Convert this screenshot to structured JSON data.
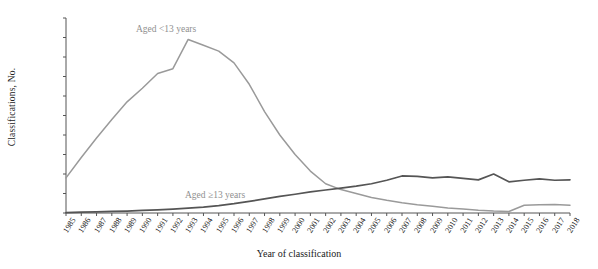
{
  "axes": {
    "ylabel": "Classifications, No.",
    "xlabel": "Year of classification",
    "yticks": [
      "0",
      "100",
      "200",
      "300",
      "400",
      "500",
      "600",
      "700",
      "800",
      "900",
      "1,000"
    ],
    "ylim": [
      0,
      1000
    ]
  },
  "labels": {
    "young": "Aged <13 years",
    "old": "Aged ≥13 years"
  },
  "colors": {
    "young_line": "#9a9a9a",
    "old_line": "#555555",
    "axis": "#555555",
    "text": "#222222"
  },
  "chart_data": {
    "type": "line",
    "title": "",
    "xlabel": "Year of classification",
    "ylabel": "Classifications, No.",
    "ylim": [
      0,
      1000
    ],
    "grid": false,
    "legend": "inline-annotations",
    "x": [
      1985,
      1986,
      1987,
      1988,
      1989,
      1990,
      1991,
      1992,
      1993,
      1994,
      1995,
      1996,
      1997,
      1998,
      1999,
      2000,
      2001,
      2002,
      2003,
      2004,
      2005,
      2006,
      2007,
      2008,
      2009,
      2010,
      2011,
      2012,
      2013,
      2014,
      2015,
      2016,
      2017,
      2018
    ],
    "categories": [
      "1985",
      "1986",
      "1987",
      "1988",
      "1989",
      "1990",
      "1991",
      "1992",
      "1993",
      "1994",
      "1995",
      "1996",
      "1997",
      "1998",
      "1999",
      "2000",
      "2001",
      "2002",
      "2003",
      "2004",
      "2005",
      "2006",
      "2007",
      "2008",
      "2009",
      "2010",
      "2011",
      "2012",
      "2013",
      "2014",
      "2015",
      "2016",
      "2017",
      "2018"
    ],
    "series": [
      {
        "name": "Aged <13 years",
        "color": "#9a9a9a",
        "values": [
          180,
          285,
          385,
          480,
          570,
          640,
          715,
          740,
          890,
          860,
          830,
          770,
          660,
          520,
          400,
          300,
          215,
          150,
          120,
          100,
          80,
          65,
          52,
          42,
          34,
          26,
          20,
          14,
          10,
          8,
          40,
          42,
          44,
          40
        ]
      },
      {
        "name": "Aged ≥13 years",
        "color": "#555555",
        "values": [
          2,
          4,
          6,
          8,
          10,
          13,
          16,
          20,
          25,
          30,
          38,
          48,
          60,
          72,
          85,
          96,
          108,
          118,
          128,
          138,
          150,
          168,
          190,
          188,
          180,
          185,
          178,
          170,
          200,
          160,
          168,
          175,
          168,
          170
        ]
      }
    ]
  }
}
